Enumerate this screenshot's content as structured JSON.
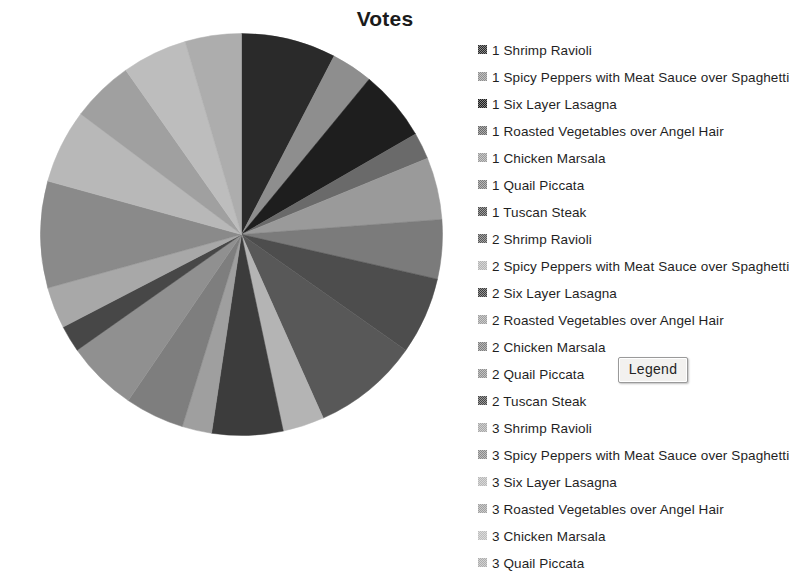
{
  "chart_data": {
    "type": "pie",
    "title": "Votes",
    "xlabel": "",
    "ylabel": "",
    "legend_position": "right",
    "grid": false,
    "categories": [
      "1 Shrimp Ravioli",
      "1 Spicy Peppers with Meat Sauce over  Spaghetti",
      "1 Six Layer Lasagna",
      "1 Roasted Vegetables over Angel Hair",
      "1 Chicken  Marsala",
      "1 Quail Piccata",
      "1 Tuscan Steak",
      "2 Shrimp Ravioli",
      "2 Spicy Peppers with Meat Sauce over  Spaghetti",
      "2 Six Layer Lasagna",
      "2 Roasted Vegetables over Angel Hair",
      "2 Chicken  Marsala",
      "2 Quail Piccata",
      "2 Tuscan Steak",
      "3 Shrimp Ravioli",
      "3 Spicy Peppers with Meat Sauce over  Spaghetti",
      "3 Six Layer Lasagna",
      "3 Roasted Vegetables over Angel Hair",
      "3 Chicken  Marsala",
      "3 Quail Piccata"
    ],
    "values": [
      32,
      14,
      24,
      9,
      21,
      20,
      26,
      36,
      14,
      24,
      10,
      20,
      24,
      9,
      14,
      36,
      25,
      21,
      22,
      19
    ],
    "colors": [
      "#2a2a2a",
      "#8e8e8e",
      "#1e1e1e",
      "#6a6a6a",
      "#9a9a9a",
      "#7b7b7b",
      "#4d4d4d",
      "#585858",
      "#b4b4b4",
      "#3c3c3c",
      "#9f9f9f",
      "#7e7e7e",
      "#909090",
      "#474747",
      "#a8a8a8",
      "#8a8a8a",
      "#b8b8b8",
      "#a0a0a0",
      "#bdbdbd",
      "#adadad"
    ],
    "slice_angles_deg": [
      [
        0,
        48
      ],
      [
        48,
        62
      ],
      [
        62,
        86
      ],
      [
        86,
        95
      ],
      [
        95,
        116
      ],
      [
        116,
        136
      ],
      [
        136,
        162
      ],
      [
        162,
        198
      ],
      [
        198,
        212
      ],
      [
        212,
        236
      ],
      [
        236,
        246
      ],
      [
        246,
        266
      ],
      [
        266,
        290
      ],
      [
        290,
        299
      ],
      [
        299,
        313
      ],
      [
        313,
        349
      ],
      [
        349,
        14
      ],
      [
        14,
        35
      ],
      [
        35,
        57
      ],
      [
        57,
        76
      ]
    ],
    "pie": {
      "center_x": 241,
      "center_y": 234,
      "radius": 201,
      "start_angle_deg": 0
    }
  },
  "legend_button": {
    "label": "Legend"
  }
}
